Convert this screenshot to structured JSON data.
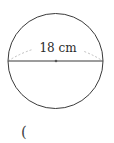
{
  "header": {
    "cropped_text": ""
  },
  "figure": {
    "shape": "circle",
    "diameter_label": "18 cm",
    "diameter_value": 18,
    "unit": "cm",
    "center_marked": true,
    "colors": {
      "outline": "#3a3a3a",
      "diameter_line": "#3a3a3a",
      "arc_dashed": "#b8b8b8",
      "center_dot": "#555555"
    }
  },
  "answer": {
    "open_paren": "("
  }
}
